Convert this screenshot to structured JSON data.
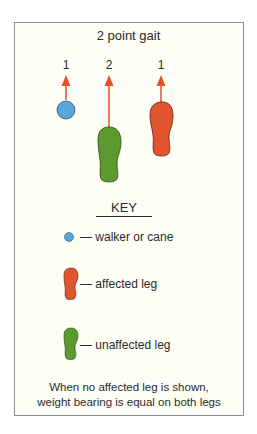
{
  "title": "2 point gait",
  "steps": {
    "cane": "1",
    "unaffected_leg": "2",
    "affected_leg": "1"
  },
  "key": {
    "heading": "KEY",
    "items": [
      {
        "symbol": "blue-circle",
        "label": "— walker or cane"
      },
      {
        "symbol": "red-footprint",
        "label": "— affected leg"
      },
      {
        "symbol": "green-footprint",
        "label": "— unaffected leg"
      }
    ]
  },
  "footer": {
    "line1": "When no affected leg is shown,",
    "line2": "weight bearing is equal on both legs"
  },
  "colors": {
    "cane": "#5aa6dc",
    "affected_leg": "#e0542e",
    "unaffected_leg": "#5a9a2e",
    "arrow": "#e8502a",
    "background": "#fffef6",
    "border": "#8e8e8e"
  }
}
